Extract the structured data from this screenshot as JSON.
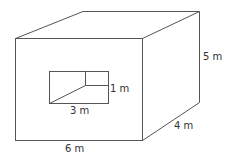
{
  "diagram": {
    "type": "rectangular-prism-with-cutout",
    "colors": {
      "stroke": "#555555",
      "text": "#333333",
      "background": "#ffffff"
    },
    "labels": {
      "width": "6 m",
      "height": "5 m",
      "depth": "4 m",
      "cutout_width": "3 m",
      "cutout_height": "1 m"
    },
    "prism": {
      "front_face": {
        "x1": 15,
        "y1": 38,
        "x2": 142,
        "y2": 140
      },
      "back_offset": {
        "dx": 57,
        "dy": -27
      }
    },
    "cutout": {
      "rect": {
        "x1": 49,
        "y1": 71,
        "x2": 109,
        "y2": 103
      },
      "inner_corner": {
        "x": 85,
        "y": 85
      }
    }
  }
}
